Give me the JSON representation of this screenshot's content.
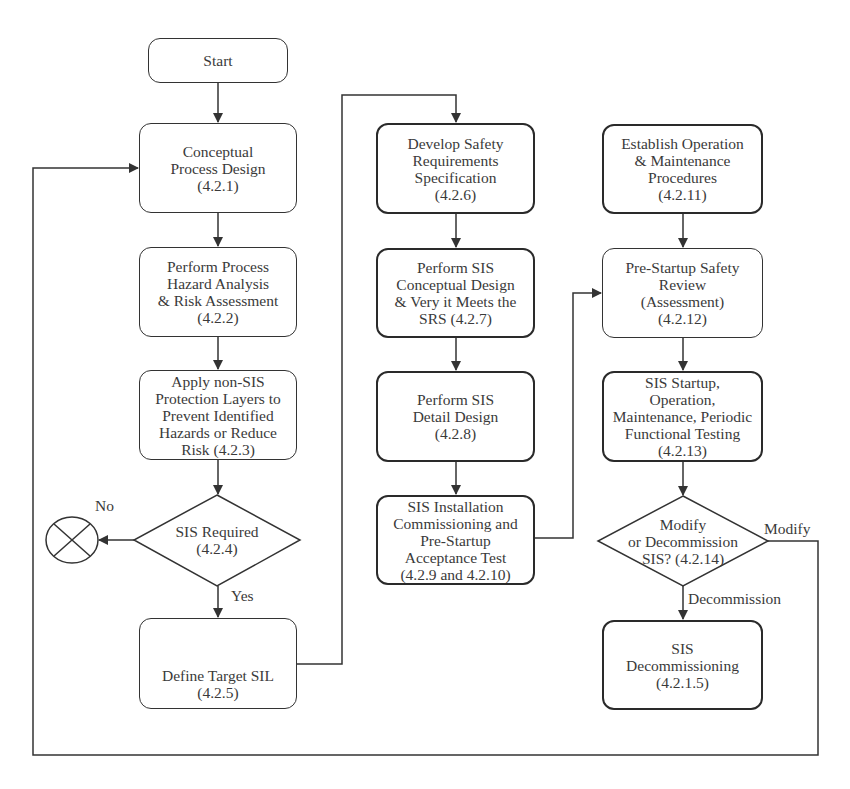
{
  "diagram": {
    "nodes": {
      "start": {
        "lines": [
          "Start"
        ]
      },
      "conceptual_process_design": {
        "lines": [
          "Conceptual",
          "Process Design",
          "(4.2.1)"
        ]
      },
      "process_hazard_analysis": {
        "lines": [
          "Perform Process",
          "Hazard Analysis",
          "& Risk Assessment",
          "(4.2.2)"
        ]
      },
      "non_sis_protection": {
        "lines": [
          "Apply non-SIS",
          "Protection Layers to",
          "Prevent Identified",
          "Hazards  or Reduce",
          "Risk (4.2.3)"
        ]
      },
      "sis_required": {
        "lines": [
          "SIS Required",
          "(4.2.4)"
        ]
      },
      "define_target_sil": {
        "lines": [
          "Define Target SIL",
          "(4.2.5)"
        ]
      },
      "develop_srs": {
        "lines": [
          "Develop Safety",
          "Requirements",
          "Specification",
          "(4.2.6)"
        ]
      },
      "sis_conceptual_design": {
        "lines": [
          "Perform SIS",
          "Conceptual Design",
          "& Very it Meets the",
          "SRS (4.2.7)"
        ]
      },
      "sis_detail_design": {
        "lines": [
          "Perform SIS",
          "Detail Design",
          "(4.2.8)"
        ]
      },
      "sis_installation": {
        "lines": [
          "SIS Installation",
          "Commissioning and",
          "Pre-Startup",
          "Acceptance Test",
          "(4.2.9 and 4.2.10)"
        ]
      },
      "operation_maintenance_procedures": {
        "lines": [
          "Establish Operation",
          "& Maintenance",
          "Procedures",
          "(4.2.11)"
        ]
      },
      "pre_startup_review": {
        "lines": [
          "Pre-Startup Safety",
          "Review",
          "(Assessment)",
          "(4.2.12)"
        ]
      },
      "sis_startup": {
        "lines": [
          "SIS Startup,",
          "Operation,",
          "Maintenance, Periodic",
          "Functional Testing",
          "(4.2.13)"
        ]
      },
      "modify_or_decommission": {
        "lines": [
          "Modify",
          "or Decommission",
          "SIS? (4.2.14)"
        ]
      },
      "sis_decommissioning": {
        "lines": [
          "SIS",
          "Decommissioning",
          "(4.2.1.5)"
        ]
      }
    },
    "edge_labels": {
      "no": "No",
      "yes": "Yes",
      "modify": "Modify",
      "decommission": "Decommission"
    },
    "colors": {
      "stroke": "#333333",
      "text": "#3a3a3a",
      "background": "#ffffff"
    }
  }
}
